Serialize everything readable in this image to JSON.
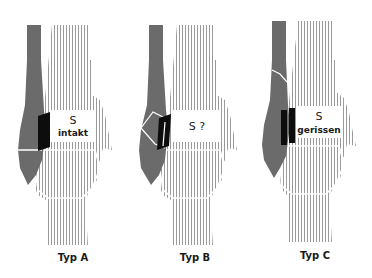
{
  "figure": {
    "panels": [
      {
        "id": "A",
        "caption": "Typ A",
        "box_title": "S",
        "box_sub": "intakt",
        "x": 0
      },
      {
        "id": "B",
        "caption": "Typ B",
        "box_title": "S ?",
        "box_sub": "",
        "x": 125
      },
      {
        "id": "C",
        "caption": "Typ C",
        "box_title": "S",
        "box_sub": "gerissen",
        "x": 250
      }
    ]
  },
  "colors": {
    "fibula": "#6b6b6b",
    "hatch": "#9a9a9a",
    "syndesmosis": "#0d0d0d",
    "background": "#ffffff"
  }
}
